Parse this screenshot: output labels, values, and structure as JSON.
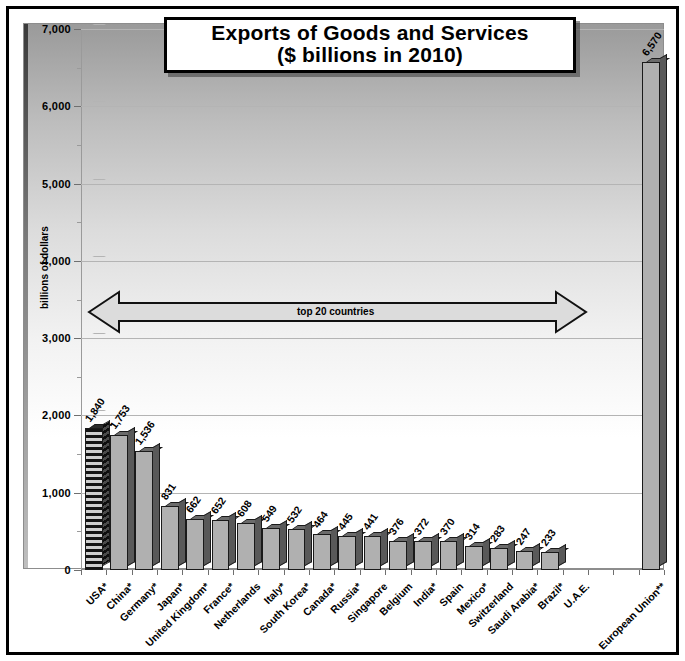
{
  "chart_data": {
    "type": "bar",
    "title": "Exports of Goods and Services",
    "subtitle": "($ billions in 2010)",
    "xlabel": "",
    "ylabel": "billions of dollars",
    "ylim": [
      0,
      7000
    ],
    "ytick_labels": [
      "0",
      "1,000",
      "2,000",
      "3,000",
      "4,000",
      "5,000",
      "6,000",
      "7,000"
    ],
    "ytick_values": [
      0,
      1000,
      2000,
      3000,
      4000,
      5000,
      6000,
      7000
    ],
    "minor_tick_step": 500,
    "grid": true,
    "legend": "none",
    "categories": [
      "USA*",
      "China*",
      "Germany*",
      "Japan*",
      "United Kingdom*",
      "France*",
      "Netherlands",
      "Italy*",
      "South Korea*",
      "Canada*",
      "Russia*",
      "Singapore",
      "Belgium",
      "India*",
      "Spain",
      "Mexico*",
      "Switzerland",
      "Saudi Arabia*",
      "Brazil*",
      "U.A.E.",
      "",
      "",
      "European Union**"
    ],
    "values": [
      1840,
      1753,
      1536,
      831,
      662,
      652,
      608,
      549,
      532,
      464,
      445,
      441,
      376,
      372,
      370,
      314,
      283,
      247,
      233,
      null,
      null,
      null,
      6570
    ],
    "bars": [
      {
        "label": "USA*",
        "value": 1840,
        "value_text": "1,840",
        "style": "hatched"
      },
      {
        "label": "China*",
        "value": 1753,
        "value_text": "1,753",
        "style": "solid"
      },
      {
        "label": "Germany*",
        "value": 1536,
        "value_text": "1,536",
        "style": "solid"
      },
      {
        "label": "Japan*",
        "value": 831,
        "value_text": "831",
        "style": "solid"
      },
      {
        "label": "United Kingdom*",
        "value": 662,
        "value_text": "662",
        "style": "solid"
      },
      {
        "label": "France*",
        "value": 652,
        "value_text": "652",
        "style": "solid"
      },
      {
        "label": "Netherlands",
        "value": 608,
        "value_text": "608",
        "style": "solid"
      },
      {
        "label": "Italy*",
        "value": 549,
        "value_text": "549",
        "style": "solid"
      },
      {
        "label": "South Korea*",
        "value": 532,
        "value_text": "532",
        "style": "solid"
      },
      {
        "label": "Canada*",
        "value": 464,
        "value_text": "464",
        "style": "solid"
      },
      {
        "label": "Russia*",
        "value": 445,
        "value_text": "445",
        "style": "solid"
      },
      {
        "label": "Singapore",
        "value": 441,
        "value_text": "441",
        "style": "solid"
      },
      {
        "label": "Belgium",
        "value": 376,
        "value_text": "376",
        "style": "solid"
      },
      {
        "label": "India*",
        "value": 372,
        "value_text": "372",
        "style": "solid"
      },
      {
        "label": "Spain",
        "value": 370,
        "value_text": "370",
        "style": "solid"
      },
      {
        "label": "Mexico*",
        "value": 314,
        "value_text": "314",
        "style": "solid"
      },
      {
        "label": "Switzerland",
        "value": 283,
        "value_text": "283",
        "style": "solid"
      },
      {
        "label": "Saudi Arabia*",
        "value": 247,
        "value_text": "247",
        "style": "solid"
      },
      {
        "label": "Brazil*",
        "value": 233,
        "value_text": "233",
        "style": "solid"
      },
      {
        "label": "U.A.E.",
        "value": null,
        "value_text": "",
        "style": "none"
      },
      {
        "label": "",
        "value": null,
        "value_text": "",
        "style": "none"
      },
      {
        "label": "",
        "value": null,
        "value_text": "",
        "style": "none"
      },
      {
        "label": "European Union**",
        "value": 6570,
        "value_text": "6,570",
        "style": "solid"
      }
    ],
    "annotations": [
      {
        "name": "top-20-arrow",
        "text": "top 20 countries",
        "type": "double-headed-arrow"
      }
    ]
  },
  "colors": {
    "bar_face": "#b0b0b0",
    "bar_side": "#595959",
    "bar_top": "#6b6b6b",
    "outline": "#1a1a1a",
    "grid": "#b4b4b4",
    "frame": "#000000"
  }
}
